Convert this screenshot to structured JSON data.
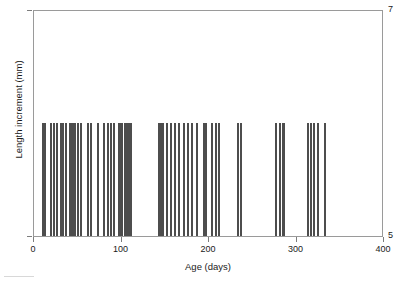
{
  "chart_data": {
    "type": "scatter",
    "plot_style": "rug-strip-plot",
    "title": "",
    "xlabel": "Age (days)",
    "ylabel": "Length increment (mm)",
    "xlim": [
      0,
      400
    ],
    "ylim": [
      5,
      7
    ],
    "xticks": [
      0,
      100,
      200,
      300,
      400
    ],
    "xticklabels": [
      "0",
      "100",
      "200",
      "300",
      "400"
    ],
    "yticks": [
      5,
      7
    ],
    "yticklabels": [
      "5",
      "7"
    ],
    "grid": false,
    "legend": null,
    "series": [
      {
        "name": "Length increment observations",
        "bar_top_value": 6.0,
        "bar_bottom_value": 5.0,
        "x": [
          10,
          12,
          19,
          23,
          26,
          31,
          33,
          36,
          41,
          43,
          45,
          47,
          50,
          54,
          62,
          65,
          73,
          80,
          85,
          88,
          91,
          97,
          99,
          101,
          104,
          106,
          109,
          111,
          143,
          145,
          147,
          152,
          157,
          161,
          166,
          171,
          176,
          181,
          186,
          194,
          197,
          203,
          208,
          211,
          233,
          237,
          277,
          281,
          284,
          286,
          313,
          316,
          320,
          325,
          333
        ]
      }
    ]
  },
  "axis": {
    "y_top_label": "7",
    "y_bottom_label": "5",
    "y_title": "Length increment (mm)",
    "x_title": "Age (days)",
    "x_labels": [
      "0",
      "100",
      "200",
      "300",
      "400"
    ]
  },
  "colors": {
    "bar": "#4d4d4d",
    "frame": "#9a9a9a",
    "text": "#1a1a1a",
    "background": "#ffffff"
  }
}
